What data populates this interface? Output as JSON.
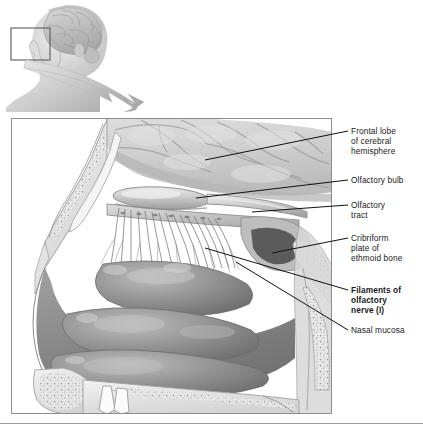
{
  "figure": {
    "kind": "anatomical-illustration",
    "inset": {
      "description": "Lateral view of head with brain, locator box over nasal region",
      "locator_box": "nasal-region",
      "arrow": "curved-arrow-to-detail"
    },
    "view": "midsagittal section of nasal cavity"
  },
  "labels": [
    {
      "id": "frontal-lobe",
      "lines": [
        "Frontal lobe",
        "of cerebral",
        "hemisphere"
      ],
      "bold": false
    },
    {
      "id": "olfactory-bulb",
      "lines": [
        "Olfactory bulb"
      ],
      "bold": false
    },
    {
      "id": "olfactory-tract",
      "lines": [
        "Olfactory",
        "tract"
      ],
      "bold": false
    },
    {
      "id": "cribriform-plate",
      "lines": [
        "Cribriform",
        "plate of",
        "ethmoid bone"
      ],
      "bold": false
    },
    {
      "id": "filaments",
      "lines": [
        "Filaments of",
        "olfactory",
        "nerve (I)"
      ],
      "bold": true
    },
    {
      "id": "nasal-mucosa",
      "lines": [
        "Nasal mucosa"
      ],
      "bold": false
    }
  ],
  "colors": {
    "frame_border": "#8d8d8d",
    "leader_line": "#111111",
    "brain": "#cfcfcf",
    "mucosa": "#8f8f8f",
    "bone": "#e6e6e6",
    "background": "#ffffff",
    "text": "#1a1a1a"
  }
}
